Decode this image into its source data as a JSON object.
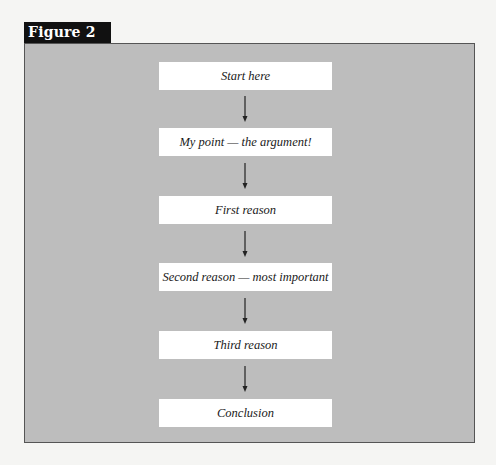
{
  "figure": {
    "label": "Figure 2",
    "colors": {
      "page_background": "#f5f5f3",
      "frame_background": "#bdbdbd",
      "frame_border": "#555555",
      "label_background": "#111111",
      "label_text": "#ffffff",
      "box_background": "#ffffff",
      "box_text": "#1a1a1a",
      "arrow": "#222222"
    }
  },
  "flowchart": {
    "direction": "top-to-bottom",
    "nodes": [
      {
        "id": "n1",
        "label": "Start here"
      },
      {
        "id": "n2",
        "label": "My point — the argument!"
      },
      {
        "id": "n3",
        "label": "First reason"
      },
      {
        "id": "n4",
        "label": "Second reason — most important"
      },
      {
        "id": "n5",
        "label": "Third reason"
      },
      {
        "id": "n6",
        "label": "Conclusion"
      }
    ],
    "edges": [
      {
        "from": "n1",
        "to": "n2",
        "icon": "arrow-down-icon"
      },
      {
        "from": "n2",
        "to": "n3",
        "icon": "arrow-down-icon"
      },
      {
        "from": "n3",
        "to": "n4",
        "icon": "arrow-down-icon"
      },
      {
        "from": "n4",
        "to": "n5",
        "icon": "arrow-down-icon"
      },
      {
        "from": "n5",
        "to": "n6",
        "icon": "arrow-down-icon"
      }
    ]
  }
}
